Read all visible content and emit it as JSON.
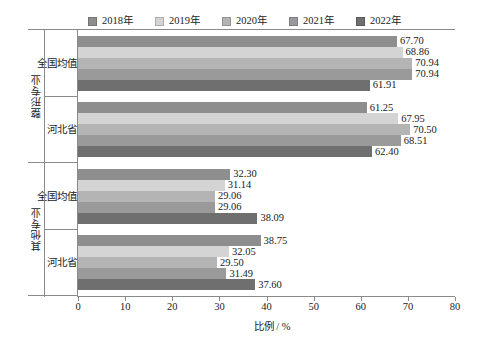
{
  "chart_data": {
    "type": "bar",
    "orientation": "horizontal",
    "title": "",
    "xlabel": "比例 / %",
    "ylabel": "",
    "xlim": [
      0,
      80
    ],
    "xticks": [
      0,
      10,
      20,
      30,
      40,
      50,
      60,
      70,
      80
    ],
    "grid": false,
    "legend_position": "top-center",
    "legend": [
      "2018年",
      "2019年",
      "2020年",
      "2021年",
      "2022年"
    ],
    "series": [
      {
        "name": "2018年",
        "color": "#8e8e8e",
        "values": [
          67.7,
          61.25,
          32.3,
          38.75
        ]
      },
      {
        "name": "2019年",
        "color": "#d4d4d4",
        "values": [
          68.86,
          67.95,
          31.14,
          32.05
        ]
      },
      {
        "name": "2020年",
        "color": "#b4b4b4",
        "values": [
          70.94,
          70.5,
          29.06,
          29.5
        ]
      },
      {
        "name": "2021年",
        "color": "#9a9a9a",
        "values": [
          70.94,
          68.51,
          29.06,
          31.49
        ]
      },
      {
        "name": "2022年",
        "color": "#6f6f6f",
        "values": [
          61.91,
          62.4,
          38.09,
          37.6
        ]
      }
    ],
    "groups": [
      {
        "major": "整形专业",
        "categories": [
          "全国均值",
          "河北省"
        ],
        "bars": [
          {
            "category": "全国均值",
            "values": [
              67.7,
              68.86,
              70.94,
              70.94,
              61.91
            ]
          },
          {
            "category": "河北省",
            "values": [
              61.25,
              67.95,
              70.5,
              68.51,
              62.4
            ]
          }
        ]
      },
      {
        "major": "其他专业",
        "categories": [
          "全国均值",
          "河北省"
        ],
        "bars": [
          {
            "category": "全国均值",
            "values": [
              32.3,
              31.14,
              29.06,
              29.06,
              38.09
            ]
          },
          {
            "category": "河北省",
            "values": [
              38.75,
              32.05,
              29.5,
              31.49,
              37.6
            ]
          }
        ]
      }
    ],
    "data_labels": [
      [
        "67.70",
        "68.86",
        "70.94",
        "70.94",
        "61.91"
      ],
      [
        "61.25",
        "67.95",
        "70.50",
        "68.51",
        "62.40"
      ],
      [
        "32.30",
        "31.14",
        "29.06",
        "29.06",
        "38.09"
      ],
      [
        "38.75",
        "32.05",
        "29.50",
        "31.49",
        "37.60"
      ]
    ],
    "xtick_labels": [
      "0",
      "10",
      "20",
      "30",
      "40",
      "50",
      "60",
      "70",
      "80"
    ],
    "axis_color": "#8a8a8a",
    "text_color": "#222222"
  }
}
